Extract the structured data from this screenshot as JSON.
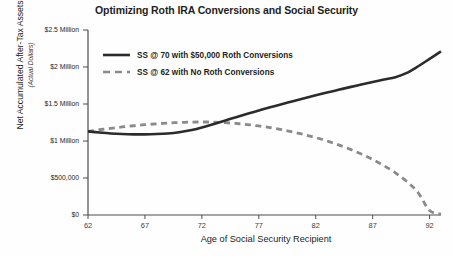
{
  "chart_data": {
    "type": "line",
    "title": "Optimizing Roth IRA Conversions and Social Security",
    "xlabel": "Age of Social Security Recipient",
    "ylabel": "Net Accumulated After-Tax Assets",
    "ylabel_sub": "(Actual Dollars)",
    "xlim": [
      62,
      93
    ],
    "ylim": [
      0,
      2500000
    ],
    "grid": false,
    "legend_position": "top-left-inside",
    "x_ticks": [
      62,
      67,
      72,
      77,
      82,
      87,
      92
    ],
    "x_tick_labels": [
      "62",
      "67",
      "72",
      "77",
      "82",
      "87",
      "92"
    ],
    "y_ticks": [
      0,
      500000,
      1000000,
      1500000,
      2000000,
      2500000
    ],
    "y_tick_labels": [
      "$0",
      "$500,000",
      "$1 Million",
      "$1.5 Million",
      "$2 Million",
      "$2.5 Million"
    ],
    "x": [
      62,
      63,
      64,
      65,
      66,
      67,
      68,
      69,
      70,
      71,
      72,
      73,
      74,
      75,
      76,
      77,
      78,
      79,
      80,
      81,
      82,
      83,
      84,
      85,
      86,
      87,
      88,
      89,
      90,
      91,
      92,
      93
    ],
    "series": [
      {
        "name": "SS @ 70 with $50,000 Roth Conversions",
        "style": "solid",
        "color": "#2b2b2b",
        "values": [
          1130000,
          1115000,
          1102000,
          1094000,
          1090000,
          1090000,
          1094000,
          1102000,
          1118000,
          1145000,
          1183000,
          1228000,
          1275000,
          1322000,
          1368000,
          1412000,
          1455000,
          1497000,
          1538000,
          1578000,
          1617000,
          1655000,
          1692000,
          1728000,
          1763000,
          1797000,
          1830000,
          1862000,
          1920000,
          2010000,
          2110000,
          2210000
        ]
      },
      {
        "name": "SS @ 62 with No Roth Conversions",
        "style": "dashed",
        "color": "#8a8a8a",
        "values": [
          1130000,
          1152000,
          1172000,
          1190000,
          1206000,
          1220000,
          1232000,
          1242000,
          1250000,
          1255000,
          1257000,
          1255000,
          1248000,
          1237000,
          1222000,
          1203000,
          1180000,
          1153000,
          1122000,
          1086000,
          1046000,
          1000000,
          948000,
          890000,
          824000,
          750000,
          666000,
          570000,
          452000,
          300000,
          60000,
          12000
        ]
      }
    ]
  },
  "legend": {
    "items": [
      {
        "label": "SS @ 70 with $50,000 Roth Conversions",
        "style": "solid"
      },
      {
        "label": "SS @ 62 with No Roth Conversions",
        "style": "dashed"
      }
    ]
  },
  "colors": {
    "solid_series": "#2b2b2b",
    "dashed_series": "#8a8a8a",
    "axis": "#4d4d4d",
    "text": "#231f20",
    "background": "#fefefe"
  }
}
